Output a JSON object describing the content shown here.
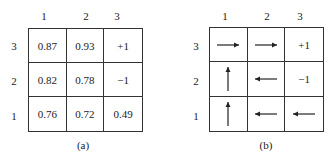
{
  "panels": [
    {
      "caption": "(a)",
      "col_labels": [
        "1",
        "2",
        "3"
      ],
      "row_labels": [
        "3",
        "2",
        "1"
      ],
      "cells": [
        [
          "0.87",
          "0.93",
          "+1"
        ],
        [
          "0.82",
          "0.78",
          "−1"
        ],
        [
          "0.76",
          "0.72",
          "0.49"
        ]
      ]
    },
    {
      "caption": "(b)",
      "col_labels": [
        "1",
        "2",
        "3"
      ],
      "row_labels": [
        "3",
        "2",
        "1"
      ],
      "cells": [
        [
          {
            "arrow": "right"
          },
          {
            "arrow": "right"
          },
          {
            "text": "+1"
          }
        ],
        [
          {
            "arrow": "up"
          },
          {
            "arrow": "left"
          },
          {
            "text": "−1"
          }
        ],
        [
          {
            "arrow": "up"
          },
          {
            "arrow": "left"
          },
          {
            "arrow": "left"
          }
        ]
      ]
    }
  ]
}
